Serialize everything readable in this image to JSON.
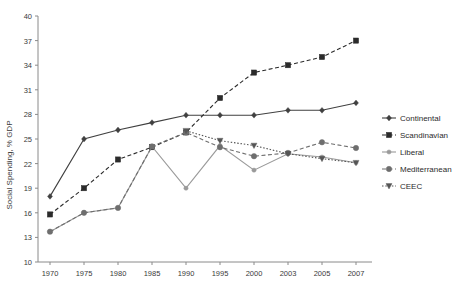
{
  "chart_data": {
    "type": "line",
    "title": "",
    "xlabel": "",
    "ylabel": "Social Spending, % GDP",
    "ylim": [
      10,
      40
    ],
    "ytick_step": 3,
    "yticks": [
      40,
      37,
      34,
      31,
      28,
      25,
      22,
      19,
      16,
      13,
      10
    ],
    "categories": [
      "1970",
      "1975",
      "1980",
      "1985",
      "1990",
      "1995",
      "2000",
      "2003",
      "2005",
      "2007"
    ],
    "x": [
      1970,
      1975,
      1980,
      1985,
      1990,
      1995,
      2000,
      2003,
      2005,
      2007
    ],
    "grid": false,
    "legend_position": "right",
    "series": [
      {
        "name": "Continental",
        "color": "#404040",
        "dash": "none",
        "marker": "diamond",
        "values": [
          18.0,
          25.0,
          26.1,
          27.0,
          27.9,
          27.9,
          27.9,
          28.5,
          28.5,
          29.4
        ]
      },
      {
        "name": "Scandinavian",
        "color": "#2b2b2b",
        "dash": "dashed",
        "marker": "square",
        "values": [
          15.8,
          19.0,
          22.5,
          24.0,
          25.8,
          30.0,
          33.1,
          34.0,
          35.0,
          37.0
        ]
      },
      {
        "name": "Liberal",
        "color": "#9a9a9a",
        "dash": "none",
        "marker": "dot",
        "values": [
          13.7,
          16.0,
          16.6,
          24.1,
          19.0,
          24.2,
          21.2,
          23.2,
          22.8,
          22.1
        ]
      },
      {
        "name": "Mediterranean",
        "color": "#6e6e6e",
        "dash": "dashed",
        "marker": "circle",
        "values": [
          13.7,
          16.0,
          16.6,
          24.1,
          25.8,
          24.0,
          22.9,
          23.3,
          24.6,
          23.9
        ]
      },
      {
        "name": "CEEC",
        "color": "#555555",
        "dash": "dotted",
        "marker": "triangle-down",
        "values": [
          null,
          null,
          null,
          null,
          26.0,
          24.8,
          24.2,
          23.2,
          22.6,
          22.1
        ]
      }
    ]
  },
  "legend": {
    "items": [
      {
        "label": "Continental"
      },
      {
        "label": "Scandinavian"
      },
      {
        "label": "Liberal"
      },
      {
        "label": "Mediterranean"
      },
      {
        "label": "CEEC"
      }
    ]
  }
}
